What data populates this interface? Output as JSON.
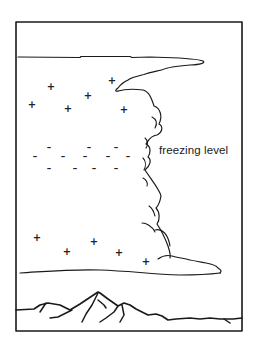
{
  "diagram": {
    "label": "freezing level",
    "colors": {
      "ink": "#1a1a1a",
      "background": "#ffffff"
    },
    "frame": {
      "x": 16,
      "y": 22,
      "width": 226,
      "height": 309
    },
    "charges": {
      "upper_positive": [
        {
          "x": 51,
          "y": 87,
          "sign": "+"
        },
        {
          "x": 112,
          "y": 81,
          "sign": "+"
        },
        {
          "x": 88,
          "y": 96,
          "sign": "+"
        },
        {
          "x": 32,
          "y": 105,
          "sign": "+"
        },
        {
          "x": 68,
          "y": 109,
          "sign": "+"
        },
        {
          "x": 124,
          "y": 110,
          "sign": "+"
        }
      ],
      "middle_negative": [
        {
          "x": 49,
          "y": 147,
          "sign": "–"
        },
        {
          "x": 89,
          "y": 147,
          "sign": "–"
        },
        {
          "x": 116,
          "y": 147,
          "sign": "–"
        },
        {
          "x": 35,
          "y": 156,
          "sign": "–"
        },
        {
          "x": 63,
          "y": 156,
          "sign": "–"
        },
        {
          "x": 85,
          "y": 156,
          "sign": "–"
        },
        {
          "x": 108,
          "y": 156,
          "sign": "–"
        },
        {
          "x": 128,
          "y": 156,
          "sign": "–"
        },
        {
          "x": 49,
          "y": 168,
          "sign": "–"
        },
        {
          "x": 75,
          "y": 168,
          "sign": "–"
        },
        {
          "x": 94,
          "y": 168,
          "sign": "–"
        },
        {
          "x": 116,
          "y": 168,
          "sign": "–"
        }
      ],
      "lower_positive": [
        {
          "x": 37,
          "y": 238,
          "sign": "+"
        },
        {
          "x": 94,
          "y": 242,
          "sign": "+"
        },
        {
          "x": 67,
          "y": 252,
          "sign": "+"
        },
        {
          "x": 119,
          "y": 253,
          "sign": "+"
        },
        {
          "x": 146,
          "y": 262,
          "sign": "+"
        }
      ]
    }
  }
}
